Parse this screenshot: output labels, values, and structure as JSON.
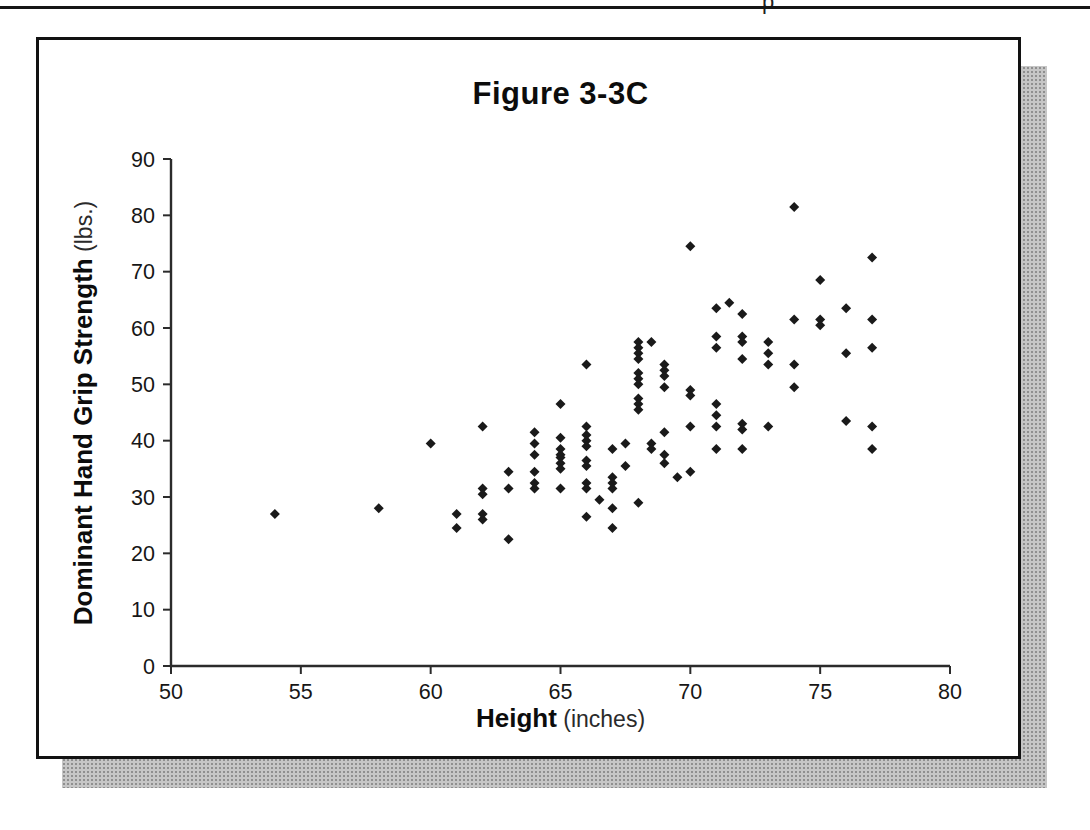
{
  "page": {
    "header_fragment": "p",
    "shadow_color": "#c6c6c6",
    "border_color": "#121212"
  },
  "chart_data": {
    "type": "scatter",
    "title": "Figure 3-3C",
    "xlabel": "Height (inches)",
    "xlabel_bold": "Height",
    "xlabel_light": " (inches)",
    "ylabel": "Dominant Hand Grip Strength (lbs.)",
    "ylabel_bold": "Dominant Hand Grip Strength",
    "ylabel_light": " (lbs.)",
    "xlim": [
      50,
      80
    ],
    "ylim": [
      0,
      90
    ],
    "xticks": [
      50,
      55,
      60,
      65,
      70,
      75,
      80
    ],
    "yticks": [
      0,
      10,
      20,
      30,
      40,
      50,
      60,
      70,
      80,
      90
    ],
    "grid": false,
    "legend": "none",
    "marker": {
      "shape": "diamond",
      "color": "#1a1a1a",
      "size_px": 10
    },
    "points": [
      [
        54,
        27
      ],
      [
        58,
        28
      ],
      [
        60,
        39.5
      ],
      [
        61,
        27
      ],
      [
        61,
        24.5
      ],
      [
        62,
        42.5
      ],
      [
        62,
        31.5
      ],
      [
        62,
        30.5
      ],
      [
        62,
        27
      ],
      [
        62,
        26
      ],
      [
        63,
        34.5
      ],
      [
        63,
        31.5
      ],
      [
        63,
        22.5
      ],
      [
        64,
        41.5
      ],
      [
        64,
        39.5
      ],
      [
        64,
        37.5
      ],
      [
        64,
        34.5
      ],
      [
        64,
        32.5
      ],
      [
        64,
        31.5
      ],
      [
        65,
        46.5
      ],
      [
        65,
        40.5
      ],
      [
        65,
        38.5
      ],
      [
        65,
        37.5
      ],
      [
        65,
        37
      ],
      [
        65,
        36
      ],
      [
        65,
        35
      ],
      [
        65,
        31.5
      ],
      [
        66,
        53.5
      ],
      [
        66,
        42.5
      ],
      [
        66,
        41
      ],
      [
        66,
        40
      ],
      [
        66,
        39
      ],
      [
        66,
        36.5
      ],
      [
        66,
        35.5
      ],
      [
        66,
        32.5
      ],
      [
        66,
        31.5
      ],
      [
        66,
        26.5
      ],
      [
        66.5,
        29.5
      ],
      [
        67,
        38.5
      ],
      [
        67,
        33.5
      ],
      [
        67,
        32.5
      ],
      [
        67,
        31.5
      ],
      [
        67,
        28
      ],
      [
        67,
        24.5
      ],
      [
        67.5,
        39.5
      ],
      [
        67.5,
        35.5
      ],
      [
        68,
        57.5
      ],
      [
        68,
        56.5
      ],
      [
        68,
        55.5
      ],
      [
        68,
        54.5
      ],
      [
        68,
        52
      ],
      [
        68,
        51
      ],
      [
        68,
        50
      ],
      [
        68,
        47.5
      ],
      [
        68,
        46.5
      ],
      [
        68,
        45.5
      ],
      [
        68,
        29
      ],
      [
        68.5,
        57.5
      ],
      [
        68.5,
        39.5
      ],
      [
        68.5,
        38.5
      ],
      [
        69,
        53.5
      ],
      [
        69,
        52.5
      ],
      [
        69,
        51.5
      ],
      [
        69,
        49.5
      ],
      [
        69,
        41.5
      ],
      [
        69,
        37.5
      ],
      [
        69,
        36
      ],
      [
        69.5,
        33.5
      ],
      [
        70,
        74.5
      ],
      [
        70,
        49
      ],
      [
        70,
        48
      ],
      [
        70,
        42.5
      ],
      [
        70,
        34.5
      ],
      [
        71,
        63.5
      ],
      [
        71,
        58.5
      ],
      [
        71,
        56.5
      ],
      [
        71,
        46.5
      ],
      [
        71,
        44.5
      ],
      [
        71,
        42.5
      ],
      [
        71,
        38.5
      ],
      [
        71.5,
        64.5
      ],
      [
        72,
        62.5
      ],
      [
        72,
        58.5
      ],
      [
        72,
        57.5
      ],
      [
        72,
        54.5
      ],
      [
        72,
        43
      ],
      [
        72,
        42
      ],
      [
        72,
        38.5
      ],
      [
        73,
        57.5
      ],
      [
        73,
        55.5
      ],
      [
        73,
        53.5
      ],
      [
        73,
        42.5
      ],
      [
        74,
        81.5
      ],
      [
        74,
        61.5
      ],
      [
        74,
        53.5
      ],
      [
        74,
        49.5
      ],
      [
        75,
        68.5
      ],
      [
        75,
        61.5
      ],
      [
        75,
        60.5
      ],
      [
        76,
        63.5
      ],
      [
        76,
        55.5
      ],
      [
        76,
        43.5
      ],
      [
        77,
        72.5
      ],
      [
        77,
        61.5
      ],
      [
        77,
        56.5
      ],
      [
        77,
        42.5
      ],
      [
        77,
        38.5
      ]
    ]
  }
}
